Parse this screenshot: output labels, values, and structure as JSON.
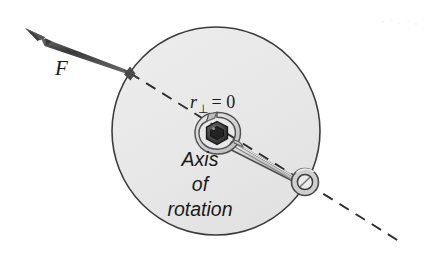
{
  "figure": {
    "kind": "physics-free-body-diagram",
    "width": 444,
    "height": 266,
    "background_color": "#ffffff"
  },
  "labels": {
    "force": "F",
    "moment_arm_variable": "r",
    "moment_arm_subscript": "⊥",
    "moment_arm_equals": "= 0",
    "moment_arm_full": "r⊥ = 0",
    "axis_line1": "Axis",
    "axis_line2": "of",
    "axis_line3": "rotation"
  },
  "colors": {
    "disk_fill": "#e9e9e9",
    "disk_stroke": "#3a3a3a",
    "vector": "#4a4a4a",
    "vector_dark": "#2b2b2b",
    "dashed_line": "#2e2e2e",
    "wrench_fill": "#d8d8d8",
    "wrench_stroke": "#4a4a4a",
    "bolt_fill": "#4a4a4a",
    "bolt_dark": "#1e1e1e",
    "text": "#1a1a1a"
  },
  "geometry": {
    "disk": {
      "cx": 216,
      "cy": 131,
      "r": 104
    },
    "axis_of_rotation_point": {
      "x": 217,
      "y": 133
    },
    "force_application_point": {
      "x": 130,
      "y": 73
    },
    "force_arrow_tip": {
      "x": 25,
      "y": 28
    },
    "line_of_action_start": {
      "x": 130,
      "y": 73
    },
    "line_of_action_end": {
      "x": 402,
      "y": 243
    },
    "wrench_box_end": {
      "x": 305,
      "y": 182
    },
    "moment_arm_value": 0
  },
  "annotations": {
    "force_vector_description": "Bold arrow pointing up and to the left, applied at the rim of the disk",
    "dashed_line_description": "Dashed line of action of the force passing through the axis of rotation",
    "wrench_description": "Wrench with its open head around the hex bolt at the axis of rotation and ring end at lower right"
  }
}
